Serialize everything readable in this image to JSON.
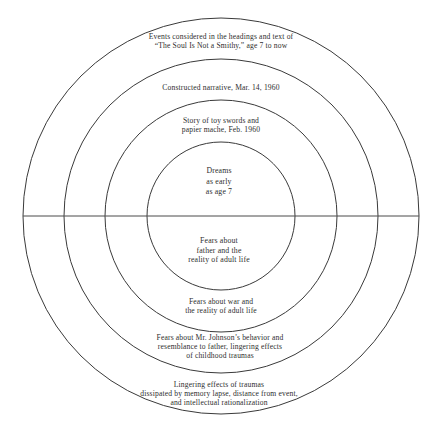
{
  "diagram": {
    "type": "concentric-circles",
    "title": "",
    "background_color": "#ffffff",
    "stroke_color": "#3a3a3a",
    "text_color": "#2e2e2e",
    "center": {
      "x": 221,
      "y": 216
    },
    "axis": {
      "name": "horizontal-diameter",
      "orientation": "horizontal",
      "from_x": 23,
      "to_x": 419,
      "y": 216
    },
    "rings": [
      {
        "index": 1,
        "radius": 198,
        "position": "outermost"
      },
      {
        "index": 2,
        "radius": 157,
        "position": "outer-middle"
      },
      {
        "index": 3,
        "radius": 116,
        "position": "inner-middle"
      },
      {
        "index": 4,
        "radius": 74,
        "position": "innermost"
      }
    ],
    "labels": {
      "ring1_top": "Events considered in the headings and text of\n“The Soul Is Not a Smithy,” age 7 to now",
      "ring2_top": "Constructed narrative, Mar. 14, 1960",
      "ring3_top": "Story of toy swords and\npapier mache, Feb. 1960",
      "ring4_top": "Dreams\nas early\nas age 7",
      "ring4_bottom": "Fears about\nfather and the\nreality of adult life",
      "ring3_bottom": "Fears about war and\nthe reality of adult life",
      "ring2_bottom": "Fears about Mr. Johnson’s behavior and\nresemblance to father, lingering effects\nof childhood traumas",
      "ring1_bottom": "Lingering effects of traumas\ndissipated by memory lapse, distance from event,\nand intellectual rationalization"
    }
  }
}
